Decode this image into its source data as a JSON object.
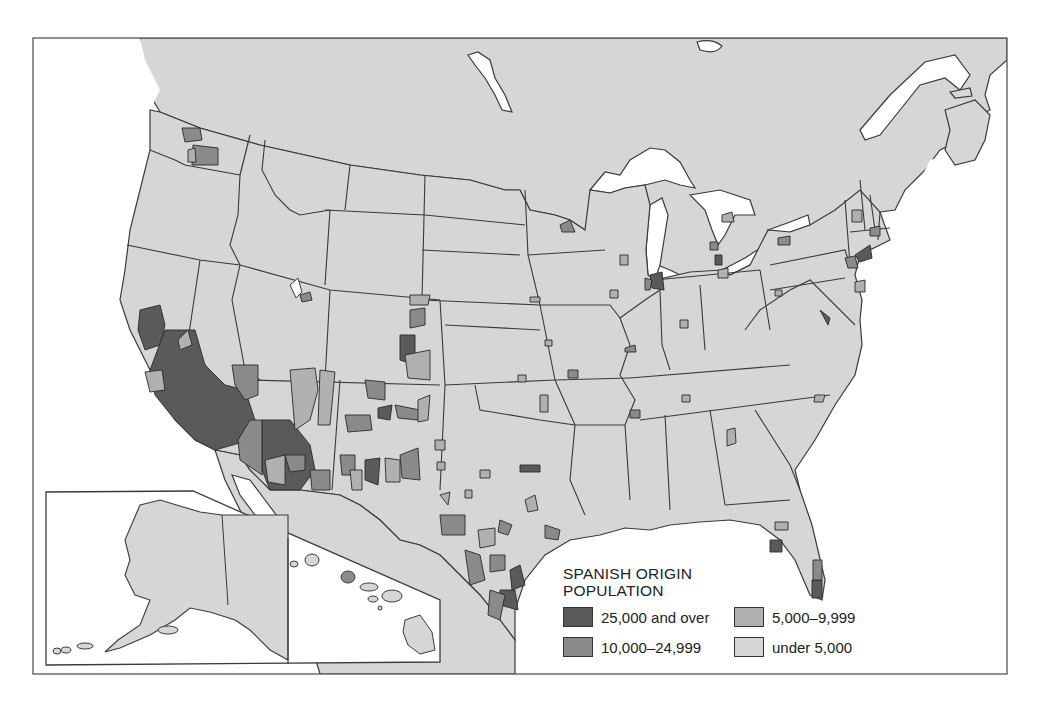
{
  "map": {
    "subject": "Spanish origin population by county, contiguous United States with Alaska and Hawaii insets",
    "colors": {
      "water": "#ffffff",
      "land_outside_us": "#d6d6d6",
      "boundary": "#3a3a3a",
      "frame": "#555555"
    },
    "insets": [
      "Alaska",
      "Hawaii"
    ]
  },
  "legend": {
    "title_line1": "SPANISH ORIGIN",
    "title_line2": "POPULATION",
    "items": [
      {
        "label": "25,000 and over",
        "color": "#5a5a5a"
      },
      {
        "label": "5,000–9,999",
        "color": "#b0b0b0"
      },
      {
        "label": "10,000–24,999",
        "color": "#8a8a8a"
      },
      {
        "label": "under 5,000",
        "color": "#d6d6d6"
      }
    ]
  }
}
